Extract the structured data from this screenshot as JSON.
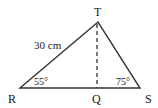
{
  "diagram": {
    "type": "triangle",
    "vertices": {
      "T": {
        "label": "T",
        "x": 98,
        "y": 22
      },
      "R": {
        "label": "R",
        "x": 20,
        "y": 88
      },
      "S": {
        "label": "S",
        "x": 140,
        "y": 88
      },
      "Q": {
        "label": "Q",
        "x": 97,
        "y": 88
      }
    },
    "side_label": "30 cm",
    "angle_R": "55°",
    "angle_S": "75°",
    "altitude": "TQ (dashed)"
  }
}
